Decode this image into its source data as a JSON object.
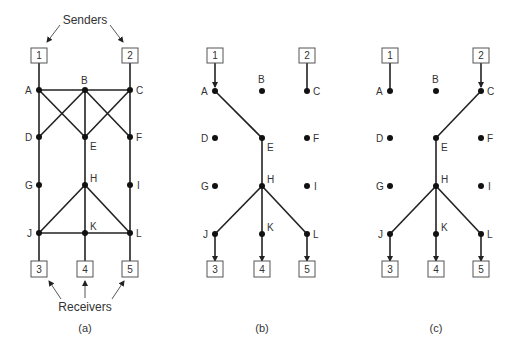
{
  "figure": {
    "senders_label": "Senders",
    "receivers_label": "Receivers",
    "panels": [
      {
        "caption": "(a)",
        "description": "Full network",
        "boxes": [
          "1",
          "2",
          "3",
          "4",
          "5"
        ],
        "nodes": [
          "A",
          "B",
          "C",
          "D",
          "E",
          "F",
          "G",
          "H",
          "I",
          "J",
          "K",
          "L"
        ],
        "edges": [
          [
            "1",
            "A"
          ],
          [
            "2",
            "C"
          ],
          [
            "A",
            "B"
          ],
          [
            "B",
            "C"
          ],
          [
            "A",
            "D"
          ],
          [
            "A",
            "E"
          ],
          [
            "B",
            "D"
          ],
          [
            "B",
            "E"
          ],
          [
            "B",
            "F"
          ],
          [
            "C",
            "E"
          ],
          [
            "C",
            "F"
          ],
          [
            "D",
            "G"
          ],
          [
            "E",
            "H"
          ],
          [
            "F",
            "I"
          ],
          [
            "G",
            "J"
          ],
          [
            "I",
            "L"
          ],
          [
            "H",
            "J"
          ],
          [
            "H",
            "K"
          ],
          [
            "H",
            "L"
          ],
          [
            "J",
            "K"
          ],
          [
            "K",
            "L"
          ],
          [
            "J",
            "3"
          ],
          [
            "K",
            "4"
          ],
          [
            "L",
            "5"
          ]
        ]
      },
      {
        "caption": "(b)",
        "description": "Multicast tree from sender 1",
        "boxes": [
          "1",
          "2",
          "3",
          "4",
          "5"
        ],
        "nodes": [
          "A",
          "B",
          "C",
          "D",
          "E",
          "F",
          "G",
          "H",
          "I",
          "J",
          "K",
          "L"
        ],
        "edges": [
          [
            "1",
            "A"
          ],
          [
            "2",
            "C"
          ],
          [
            "A",
            "E"
          ],
          [
            "E",
            "H"
          ],
          [
            "H",
            "J"
          ],
          [
            "H",
            "K"
          ],
          [
            "H",
            "L"
          ],
          [
            "J",
            "3"
          ],
          [
            "K",
            "4"
          ],
          [
            "L",
            "5"
          ]
        ]
      },
      {
        "caption": "(c)",
        "description": "Multicast tree from sender 2",
        "boxes": [
          "1",
          "2",
          "3",
          "4",
          "5"
        ],
        "nodes": [
          "A",
          "B",
          "C",
          "D",
          "E",
          "F",
          "G",
          "H",
          "I",
          "J",
          "K",
          "L"
        ],
        "edges": [
          [
            "1",
            "A"
          ],
          [
            "2",
            "C"
          ],
          [
            "C",
            "E"
          ],
          [
            "E",
            "H"
          ],
          [
            "H",
            "J"
          ],
          [
            "H",
            "K"
          ],
          [
            "H",
            "L"
          ],
          [
            "J",
            "3"
          ],
          [
            "K",
            "4"
          ],
          [
            "L",
            "5"
          ]
        ]
      }
    ]
  }
}
